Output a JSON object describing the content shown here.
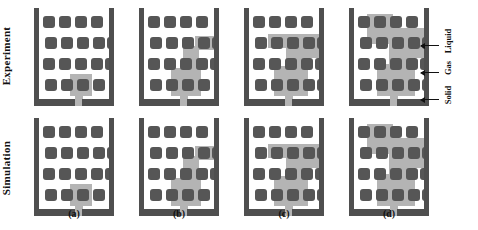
{
  "figure": {
    "rows": [
      {
        "id": "experiment",
        "label": "Experiment"
      },
      {
        "id": "simulation",
        "label": "Simulation"
      }
    ],
    "columns": [
      {
        "id": "a",
        "label": "(a)"
      },
      {
        "id": "b",
        "label": "(b)"
      },
      {
        "id": "c",
        "label": "(c)"
      },
      {
        "id": "d",
        "label": "(d)"
      }
    ],
    "legend": [
      {
        "id": "liquid",
        "label": "Liquid",
        "color": "#b4b4b4"
      },
      {
        "id": "gas",
        "label": "Gas",
        "color": "#ffffff"
      },
      {
        "id": "solid",
        "label": "Solid",
        "color": "#4f4f4f"
      }
    ],
    "colors": {
      "solid_pillar": "#565656",
      "solid_wall": "#4f4f4f",
      "liquid": "#b4b4b4",
      "gas": "#ffffff",
      "text": "#111111"
    }
  }
}
